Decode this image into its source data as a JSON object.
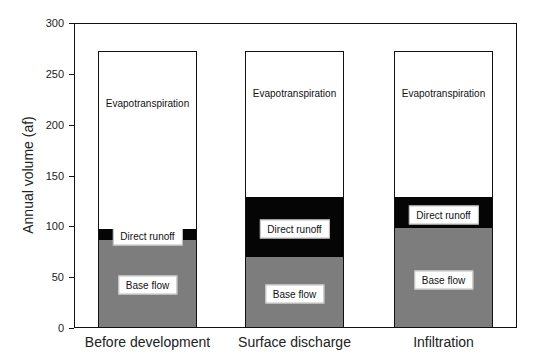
{
  "chart_data": {
    "type": "bar",
    "stacked": true,
    "title": "",
    "xlabel": "",
    "ylabel": "Annual volume (af)",
    "ylim": [
      0,
      300
    ],
    "yticks": [
      0,
      50,
      100,
      150,
      200,
      250,
      300
    ],
    "grid": false,
    "legend": "inline labels within bars",
    "categories": [
      "Before development",
      "Surface discharge",
      "Infiltration"
    ],
    "series": [
      {
        "name": "Base flow",
        "label": "Base flow",
        "color": "#7d7d7d",
        "values": [
          86,
          69,
          97
        ]
      },
      {
        "name": "Direct runoff",
        "label": "Direct runoff",
        "color": "#050505",
        "values": [
          10,
          59,
          31
        ]
      },
      {
        "name": "Evapotranspiration",
        "label": "Evapotranspiration",
        "color": "#ffffff",
        "values": [
          176,
          144,
          144
        ]
      }
    ],
    "totals": [
      272,
      272,
      272
    ]
  },
  "axis": {
    "ytick_labels": [
      "0",
      "50",
      "100",
      "150",
      "200",
      "250",
      "300"
    ]
  }
}
